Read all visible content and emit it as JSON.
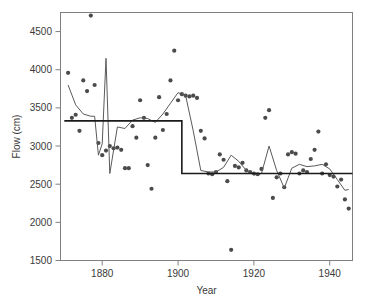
{
  "chart_data": {
    "type": "scatter",
    "title": "",
    "xlabel": "Year",
    "ylabel": "Flow (cm)",
    "xlim": [
      1869,
      1946
    ],
    "ylim": [
      1500,
      4750
    ],
    "xticks": [
      1880,
      1900,
      1920,
      1940
    ],
    "yticks": [
      1500,
      2000,
      2500,
      3000,
      3500,
      4000,
      4500
    ],
    "xtick_labels": [
      "1880",
      "1900",
      "1920",
      "1940"
    ],
    "ytick_labels": [
      "1500",
      "2000",
      "2500",
      "3000",
      "3500",
      "4000",
      "4500"
    ],
    "grid": false,
    "legend": "none",
    "marker_color": "#4b4b4b",
    "smooth_color": "#5a5a5a",
    "step_color": "#1a1a1a",
    "frame_color": "#808080",
    "series": [
      {
        "name": "Nile annual flow",
        "type": "scatter",
        "x": [
          1871,
          1872,
          1873,
          1874,
          1875,
          1876,
          1877,
          1878,
          1879,
          1880,
          1881,
          1882,
          1883,
          1884,
          1885,
          1886,
          1887,
          1888,
          1889,
          1890,
          1891,
          1892,
          1893,
          1894,
          1895,
          1896,
          1897,
          1898,
          1899,
          1900,
          1901,
          1902,
          1903,
          1904,
          1905,
          1906,
          1907,
          1908,
          1909,
          1910,
          1911,
          1912,
          1913,
          1914,
          1915,
          1916,
          1917,
          1918,
          1919,
          1920,
          1921,
          1922,
          1923,
          1924,
          1925,
          1926,
          1927,
          1928,
          1929,
          1930,
          1931,
          1932,
          1933,
          1934,
          1935,
          1936,
          1937,
          1938,
          1939,
          1940,
          1941,
          1942,
          1943,
          1944,
          1945
        ],
        "y": [
          3960,
          3370,
          3410,
          3200,
          3860,
          3720,
          4710,
          3800,
          3040,
          2880,
          2940,
          3000,
          2970,
          2980,
          2950,
          2710,
          2710,
          3260,
          3110,
          3600,
          3370,
          2750,
          2440,
          3110,
          3640,
          3210,
          3420,
          3860,
          4250,
          3600,
          3680,
          3660,
          3650,
          3660,
          3630,
          3200,
          3100,
          2640,
          2630,
          2660,
          2890,
          2820,
          2540,
          1640,
          2740,
          2720,
          2780,
          2680,
          2660,
          2640,
          2630,
          2700,
          3370,
          3470,
          2320,
          2590,
          2640,
          2460,
          2890,
          2920,
          2900,
          2640,
          2680,
          2660,
          2830,
          2950,
          3190,
          2640,
          2760,
          2620,
          2600,
          2470,
          2560,
          2300,
          2180
        ]
      },
      {
        "name": "LOWESS smooth",
        "type": "line",
        "x": [
          1871,
          1873,
          1875,
          1877,
          1878,
          1879,
          1880,
          1881,
          1882,
          1884,
          1886,
          1888,
          1890,
          1892,
          1894,
          1896,
          1898,
          1900,
          1902,
          1904,
          1906,
          1908,
          1910,
          1912,
          1914,
          1916,
          1918,
          1920,
          1922,
          1924,
          1926,
          1928,
          1930,
          1932,
          1934,
          1936,
          1938,
          1940,
          1942,
          1944,
          1945
        ],
        "y": [
          3800,
          3540,
          3420,
          3390,
          3390,
          2880,
          3030,
          4150,
          2640,
          3250,
          3230,
          3340,
          3370,
          3360,
          3310,
          3420,
          3560,
          3700,
          3660,
          3200,
          2680,
          2660,
          2660,
          2720,
          2880,
          2800,
          2680,
          2620,
          2640,
          3000,
          2680,
          2450,
          2710,
          2760,
          2730,
          2740,
          2760,
          2700,
          2560,
          2420,
          2430
        ]
      },
      {
        "name": "Step fit (changepoint)",
        "type": "step",
        "segments": [
          {
            "x_start": 1870,
            "x_end": 1901,
            "y": 3330
          },
          {
            "x_start": 1901,
            "x_end": 1946,
            "y": 2640
          }
        ]
      }
    ]
  },
  "axes": {
    "ylabel": "Flow (cm)",
    "xlabel": "Year"
  }
}
